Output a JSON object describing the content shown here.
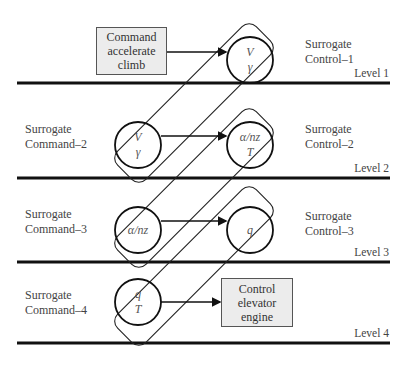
{
  "diagram": {
    "levels": [
      {
        "label": "Level 1",
        "command_label": "",
        "control_label": "Surrogate\nControl–1"
      },
      {
        "label": "Level 2",
        "command_label": "Surrogate\nCommand–2",
        "control_label": "Surrogate\nControl–2"
      },
      {
        "label": "Level 3",
        "command_label": "Surrogate\nCommand–3",
        "control_label": "Surrogate\nControl–3"
      },
      {
        "label": "Level 4",
        "command_label": "Surrogate\nCommand–4",
        "control_label": ""
      }
    ],
    "boxes": {
      "command": "Command\naccelerate\nclimb",
      "control": "Control\nelevator\nengine"
    },
    "nodes": {
      "l1_control": [
        "V",
        "γ"
      ],
      "l2_command": [
        "V",
        "γ"
      ],
      "l2_control": [
        "α/nz",
        "T"
      ],
      "l3_command": [
        "α/nz"
      ],
      "l3_control": [
        "q"
      ],
      "l4_command": [
        "q",
        "T"
      ]
    },
    "colors": {
      "line": "#111111",
      "box_fill": "#ececec",
      "text": "#444444"
    }
  }
}
